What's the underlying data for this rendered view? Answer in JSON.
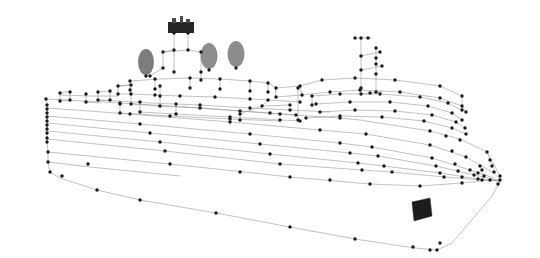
{
  "scene": {
    "title": "3D wireframe point-cloud reconstruction of a cruise ship",
    "background_color": "#ffffff",
    "vertex_color": "#1a1a1a",
    "edge_color": "#8e8e8e",
    "funnel_color": "#7d7d7d",
    "marking_color": "#1c1c1c",
    "width": 540,
    "height": 258,
    "projection": "oblique perspective, bow to the right"
  },
  "parts": {
    "hull_label": "hull",
    "superstructure_label": "superstructure",
    "bow_label": "bow",
    "stern_label": "stern",
    "funnels_label": "funnels",
    "bridge_label": "bridge mast block",
    "marking_label": "hull marking"
  },
  "chart_data": {
    "type": "scatter",
    "title": "3D wireframe point-cloud reconstruction of a cruise ship",
    "xlabel": "",
    "ylabel": "",
    "grid": false,
    "legend": null,
    "xlim": [
      0,
      540
    ],
    "ylim": [
      0,
      258
    ],
    "hull_profile": [
      [
        46,
        99
      ],
      [
        47,
        108
      ],
      [
        47,
        116
      ],
      [
        47,
        123
      ],
      [
        47,
        131
      ],
      [
        47,
        139
      ],
      [
        48,
        152
      ],
      [
        48,
        162
      ],
      [
        50,
        172
      ],
      [
        60,
        178
      ],
      [
        97,
        190
      ],
      [
        140,
        200
      ],
      [
        216,
        213
      ],
      [
        290,
        227
      ],
      [
        355,
        239
      ],
      [
        415,
        248
      ],
      [
        437,
        250
      ],
      [
        452,
        243
      ],
      [
        470,
        222
      ],
      [
        492,
        196
      ],
      [
        500,
        182
      ]
    ],
    "deck_lines": [
      {
        "name": "main_deck_edge",
        "points": [
          [
            46,
            99
          ],
          [
            120,
            103
          ],
          [
            200,
            108
          ],
          [
            280,
            114
          ],
          [
            340,
            118
          ],
          [
            360,
            120
          ],
          [
            430,
            131
          ],
          [
            460,
            139
          ],
          [
            487,
            152
          ],
          [
            500,
            176
          ]
        ]
      },
      {
        "name": "deck_2",
        "points": [
          [
            47,
            108
          ],
          [
            130,
            114
          ],
          [
            230,
            122
          ],
          [
            320,
            130
          ],
          [
            366,
            134
          ],
          [
            430,
            145
          ],
          [
            466,
            157
          ],
          [
            492,
            172
          ]
        ]
      },
      {
        "name": "deck_3",
        "points": [
          [
            47,
            116
          ],
          [
            140,
            124
          ],
          [
            250,
            134
          ],
          [
            340,
            143
          ],
          [
            372,
            147
          ],
          [
            432,
            158
          ],
          [
            470,
            170
          ],
          [
            494,
            178
          ]
        ]
      },
      {
        "name": "deck_4",
        "points": [
          [
            47,
            123
          ],
          [
            150,
            133
          ],
          [
            260,
            144
          ],
          [
            350,
            153
          ],
          [
            378,
            156
          ],
          [
            436,
            166
          ],
          [
            474,
            175
          ],
          [
            497,
            180
          ]
        ]
      },
      {
        "name": "deck_5",
        "points": [
          [
            47,
            131
          ],
          [
            160,
            142
          ],
          [
            270,
            154
          ],
          [
            358,
            163
          ],
          [
            384,
            166
          ],
          [
            440,
            173
          ],
          [
            478,
            179
          ],
          [
            499,
            181
          ]
        ]
      },
      {
        "name": "waterline",
        "points": [
          [
            48,
            152
          ],
          [
            170,
            164
          ],
          [
            290,
            177
          ],
          [
            370,
            184
          ],
          [
            420,
            186
          ],
          [
            462,
            183
          ],
          [
            488,
            180
          ],
          [
            500,
            180
          ]
        ]
      }
    ],
    "superstructure_outline": [
      [
        118,
        94
      ],
      [
        120,
        82
      ],
      [
        140,
        78
      ],
      [
        160,
        76
      ],
      [
        190,
        74
      ],
      [
        220,
        76
      ],
      [
        250,
        79
      ],
      [
        268,
        82
      ],
      [
        275,
        90
      ],
      [
        300,
        88
      ],
      [
        322,
        80
      ],
      [
        355,
        78
      ],
      [
        395,
        80
      ],
      [
        440,
        86
      ],
      [
        462,
        96
      ],
      [
        466,
        110
      ],
      [
        440,
        120
      ],
      [
        380,
        116
      ],
      [
        330,
        110
      ],
      [
        300,
        104
      ],
      [
        240,
        98
      ],
      [
        170,
        95
      ],
      [
        118,
        94
      ]
    ],
    "funnels": [
      {
        "name": "funnel-forward",
        "cx": 146,
        "cy": 62,
        "rx": 8,
        "ry": 13
      },
      {
        "name": "funnel-mid",
        "cx": 209,
        "cy": 56,
        "rx": 8.5,
        "ry": 13
      },
      {
        "name": "funnel-aft",
        "cx": 236,
        "cy": 54,
        "rx": 8.5,
        "ry": 13
      }
    ],
    "bridge_block": {
      "x": 168,
      "y": 22,
      "w": 26,
      "h": 11
    },
    "hull_marking": {
      "points": [
        [
          412,
          202
        ],
        [
          430,
          198
        ],
        [
          432,
          216
        ],
        [
          414,
          221
        ]
      ]
    },
    "mast": {
      "x": 361,
      "y": 38,
      "height": 55
    },
    "vertex_count": 268
  }
}
